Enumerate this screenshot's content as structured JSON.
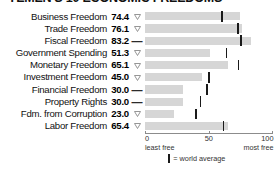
{
  "title": "YEMEN'S 10 ECONOMIC FREEDOMS",
  "axis": {
    "ticks": [
      {
        "value": 0,
        "label": "0",
        "sub": "least free"
      },
      {
        "value": 50,
        "label": "50",
        "sub": ""
      },
      {
        "value": 100,
        "label": "100",
        "sub": "most free"
      }
    ],
    "min": 0,
    "max": 100
  },
  "legend": {
    "marker_icon": "vertical-bar-icon",
    "text": "= world average"
  },
  "markers": {
    "down_triangle": "down-triangle-icon",
    "dash": "dash-icon"
  },
  "chart_data": {
    "type": "bar",
    "orientation": "horizontal",
    "title": "YEMEN'S 10 ECONOMIC FREEDOMS",
    "xlabel": "",
    "ylabel": "",
    "xlim": [
      0,
      100
    ],
    "xticks": [
      0,
      50,
      100
    ],
    "xticklabels": [
      "0",
      "50",
      "100"
    ],
    "grid": false,
    "legend_position": "bottom-center",
    "categories": [
      "Business Freedom",
      "Trade Freedom",
      "Fiscal Freedom",
      "Government Spending",
      "Monetary Freedom",
      "Investment Freedom",
      "Financial Freedom",
      "Property Rights",
      "Fdm. from Corruption",
      "Labor Freedom"
    ],
    "values": [
      74.4,
      76.1,
      83.2,
      51.3,
      65.1,
      45.0,
      30.0,
      30.0,
      23.0,
      65.4
    ],
    "value_labels": [
      "74.4",
      "76.1",
      "83.2",
      "51.3",
      "65.1",
      "45.0",
      "30.0",
      "30.0",
      "23.0",
      "65.4"
    ],
    "trend": [
      "down",
      "down",
      "flat",
      "down",
      "down",
      "down",
      "flat",
      "flat",
      "down",
      "down"
    ],
    "world_average": [
      60.6,
      72.8,
      75.4,
      63.8,
      73.4,
      50.2,
      48.5,
      43.6,
      40.2,
      61.5
    ],
    "series": [
      {
        "name": "Yemen score",
        "values": [
          74.4,
          76.1,
          83.2,
          51.3,
          65.1,
          45.0,
          30.0,
          30.0,
          23.0,
          65.4
        ]
      },
      {
        "name": "World average",
        "values": [
          60.6,
          72.8,
          75.4,
          63.8,
          73.4,
          50.2,
          48.5,
          43.6,
          40.2,
          61.5
        ]
      }
    ]
  },
  "colors": {
    "bar": "#d6d6d6",
    "average_mark": "#1a1a1a",
    "text": "#111111",
    "axis": "#8c8c8c"
  }
}
